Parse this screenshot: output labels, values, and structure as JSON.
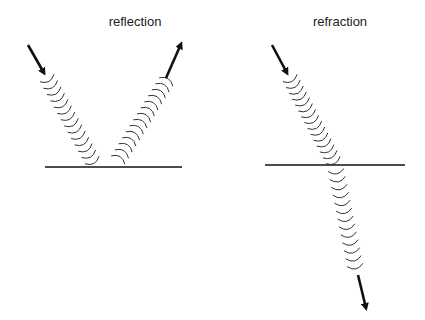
{
  "diagram": {
    "panels": [
      {
        "id": "reflection",
        "title": "reflection",
        "surface": {
          "x1": 45,
          "x2": 182,
          "y": 167
        },
        "incident": {
          "arrow_from": [
            28,
            45
          ],
          "arrow_to": [
            44,
            73
          ],
          "wave_from": [
            47,
            78
          ],
          "wave_to": [
            92,
            160
          ],
          "arcs": 14
        },
        "reflected": {
          "wave_from": [
            118,
            160
          ],
          "wave_to": [
            166,
            82
          ],
          "arcs": 14,
          "arrow_from": [
            166,
            78
          ],
          "arrow_to": [
            181,
            44
          ]
        }
      },
      {
        "id": "refraction",
        "title": "refraction",
        "surface": {
          "x1": 265,
          "x2": 405,
          "y": 165
        },
        "incident": {
          "arrow_from": [
            272,
            45
          ],
          "arrow_to": [
            287,
            73
          ],
          "wave_from": [
            290,
            78
          ],
          "wave_to": [
            333,
            160
          ],
          "arcs": 15
        },
        "refracted": {
          "wave_from": [
            336,
            170
          ],
          "wave_to": [
            355,
            265
          ],
          "arcs": 13,
          "arrow_from": [
            358,
            275
          ],
          "arrow_to": [
            366,
            308
          ]
        }
      }
    ],
    "colors": {
      "line": "#111111",
      "wave": "#333333",
      "text": "#222222"
    }
  }
}
